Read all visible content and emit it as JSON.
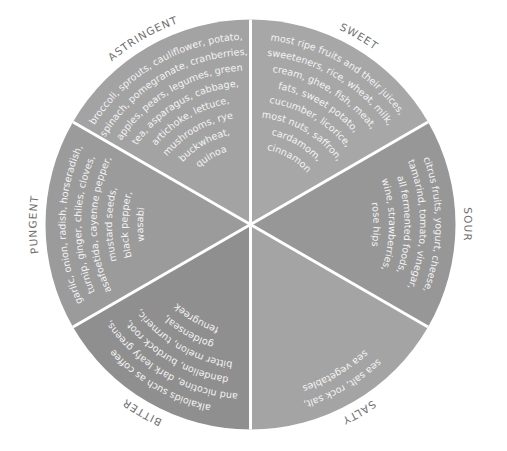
{
  "diagram": {
    "center": [
      250.5,
      224.5
    ],
    "radius": 205,
    "divider_color": "#ffffff",
    "label_color": "#6f6f6f",
    "text_color": "#f4f4f4",
    "segments": [
      {
        "name": "SWEET",
        "start_deg": 0,
        "end_deg": 60,
        "color": "#a7a7a7",
        "lines": [
          "most ripe fruits and their juices,",
          "sweeteners, rice, wheat, milk,",
          "cream, ghee, fish, meat,",
          "fats, sweet potato,",
          "cucumber, licorice,",
          "most nuts, saffron,",
          "cardamom,",
          "cinnamon"
        ]
      },
      {
        "name": "SOUR",
        "start_deg": 60,
        "end_deg": 120,
        "color": "#979797",
        "lines": [
          "citrus fruits, yogurt, cheese,",
          "tamarind, tomato, vinegar,",
          "all fermented foods,",
          "wine, strawberries,",
          "rose hips"
        ]
      },
      {
        "name": "SALTY",
        "start_deg": 120,
        "end_deg": 180,
        "color": "#a4a4a4",
        "lines": [
          "sea salt, rock salt,",
          "sea vegetables"
        ]
      },
      {
        "name": "BITTER",
        "start_deg": 180,
        "end_deg": 240,
        "color": "#8f8f8f",
        "lines": [
          "alkaloids such as coffee",
          "and nicotine, dark leafy greens,",
          "dandelion, burdock root,",
          "bitter melon, turmeric,",
          "goldenseal,",
          "fenugreek"
        ]
      },
      {
        "name": "PUNGENT",
        "start_deg": 240,
        "end_deg": 300,
        "color": "#9b9b9b",
        "lines": [
          "garlic, onion, radish, horseradish,",
          "turnip, ginger, chiles, cloves,",
          "asafoetida, cayenne pepper,",
          "mustard seeds,",
          "black pepper,",
          "wasabi"
        ]
      },
      {
        "name": "ASTRINGENT",
        "start_deg": 300,
        "end_deg": 360,
        "color": "#a3a3a3",
        "lines": [
          "broccoli, sprouts, cauliflower, potato,",
          "spinach, pomegranate, cranberries,",
          "apples, pears, legumes, green",
          "tea, asparagus, cabbage,",
          "artichoke, lettuce,",
          "mushrooms, rye",
          "buckwheat,",
          "quinoa"
        ]
      }
    ]
  }
}
